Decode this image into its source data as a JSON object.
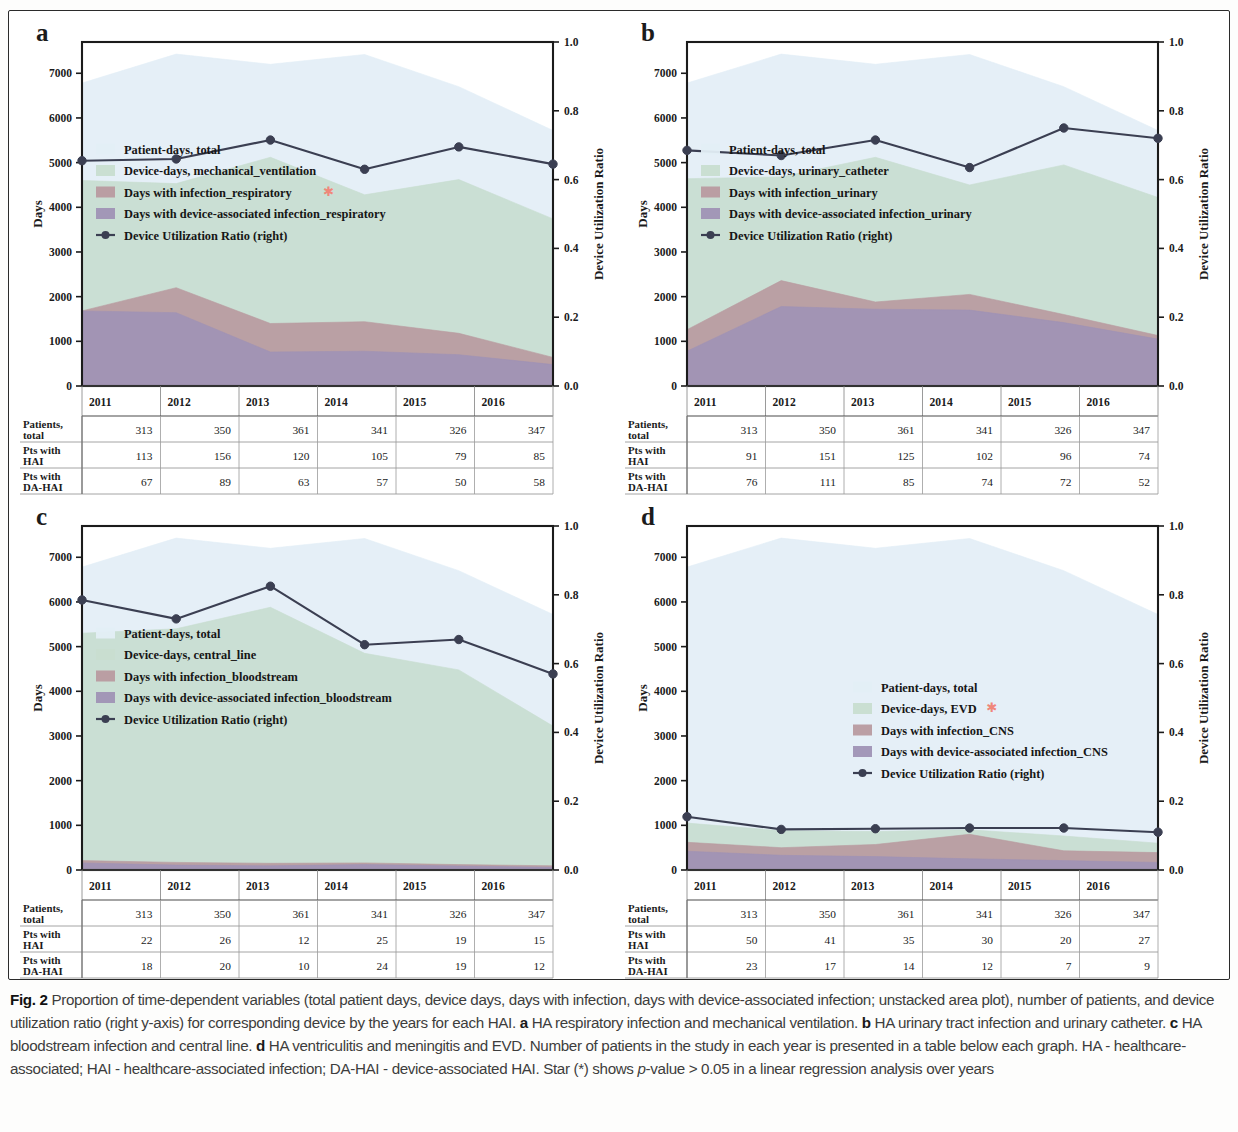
{
  "figure": {
    "label": "Fig. 2",
    "caption_parts": [
      {
        "t": "Proportion of time-dependent variables (total patient days, device days, days with infection, days with device-associated infection; unstacked area plot), number of patients, and device utilization ratio (right y-axis) for corresponding device by the years for each HAI. "
      },
      {
        "b": "a"
      },
      {
        "t": " HA respiratory infection and mechanical ventilation. "
      },
      {
        "b": "b"
      },
      {
        "t": " HA urinary tract infection and urinary catheter. "
      },
      {
        "b": "c"
      },
      {
        "t": " HA bloodstream infection and central line. "
      },
      {
        "b": "d"
      },
      {
        "t": " HA ventriculitis and meningitis and EVD. Number of patients in the study in each year is presented in a table below each graph. HA - healthcare-associated; HAI - healthcare-associated infection; DA-HAI - device-associated HAI. Star (*) shows "
      },
      {
        "i": "p"
      },
      {
        "t": "-value > 0.05 in a linear regression analysis over years"
      }
    ]
  },
  "colors": {
    "patient_days": "#e3eef6",
    "device_days": "#c8ddd0",
    "infection": "#b89aa0",
    "da_infection": "#9f92b5",
    "dur_line": "#3b3f52",
    "star": "#f0877a",
    "axis": "#1b1b1b",
    "table_border": "#9a9a9a"
  },
  "axes": {
    "left_label": "Days",
    "right_label": "Device Utilization Ratio",
    "left_ticks": [
      "0",
      "1000",
      "2000",
      "3000",
      "4000",
      "5000",
      "6000",
      "7000"
    ],
    "left_tick_values": [
      0,
      1000,
      2000,
      3000,
      4000,
      5000,
      6000,
      7000
    ],
    "right_ticks": [
      "0.0",
      "0.2",
      "0.4",
      "0.6",
      "0.8",
      "1.0"
    ],
    "right_tick_values": [
      0.0,
      0.2,
      0.4,
      0.6,
      0.8,
      1.0
    ],
    "ylim_days": [
      0,
      7700
    ],
    "ylim_ratio": [
      0.0,
      1.0
    ]
  },
  "years": [
    "2011",
    "2012",
    "2013",
    "2014",
    "2015",
    "2016"
  ],
  "table": {
    "row_labels": [
      "Patients,\ntotal",
      "Pts with\nHAI",
      "Pts with\nDA-HAI"
    ],
    "row_labels_flat": [
      [
        "Patients,",
        "total"
      ],
      [
        "Pts with",
        "HAI"
      ],
      [
        "Pts with",
        "DA-HAI"
      ]
    ]
  },
  "chart_data": [
    {
      "id": "a",
      "type": "area",
      "panel_letter": "a",
      "title": "HA respiratory infection and mechanical ventilation",
      "xlabel": "",
      "ylabel": "Days",
      "y2label": "Device Utilization Ratio",
      "ylim": [
        0,
        7700
      ],
      "y2lim": [
        0,
        1.0
      ],
      "grid": false,
      "legend_position": "upper-left",
      "x": [
        "2011",
        "2012",
        "2013",
        "2014",
        "2015",
        "2016"
      ],
      "series": [
        {
          "name": "Patient-days, total",
          "key": "patient_days",
          "star": false,
          "values": [
            6780,
            7430,
            7200,
            7420,
            6700,
            5720
          ]
        },
        {
          "name": "Device-days, mechanical_ventilation",
          "key": "device_days",
          "star": false,
          "values": [
            4600,
            4530,
            5120,
            4280,
            4620,
            3740
          ]
        },
        {
          "name": "Days with infection_respiratory",
          "key": "infection",
          "star": true,
          "values": [
            1680,
            2200,
            1400,
            1440,
            1180,
            640
          ]
        },
        {
          "name": "Days with device-associated infection_respiratory",
          "key": "da_infection",
          "star": false,
          "values": [
            1680,
            1640,
            760,
            780,
            700,
            480
          ]
        }
      ],
      "dur": {
        "name": "Device Utilization Ratio (right)",
        "values": [
          0.655,
          0.66,
          0.715,
          0.63,
          0.695,
          0.645
        ]
      },
      "table": {
        "columns": [
          "2011",
          "2012",
          "2013",
          "2014",
          "2015",
          "2016"
        ],
        "rows": [
          {
            "label_l1": "Patients,",
            "label_l2": "total",
            "star": false,
            "values": [
              "313",
              "350",
              "361",
              "341",
              "326",
              "347"
            ]
          },
          {
            "label_l1": "Pts with",
            "label_l2": "HAI",
            "star": false,
            "values": [
              "113",
              "156",
              "120",
              "105",
              "79",
              "85"
            ]
          },
          {
            "label_l1": "Pts with",
            "label_l2": "DA-HAI",
            "star": false,
            "values": [
              "67",
              "89",
              "63",
              "57",
              "50",
              "58"
            ]
          }
        ]
      }
    },
    {
      "id": "b",
      "type": "area",
      "panel_letter": "b",
      "title": "HA urinary tract infection and urinary catheter",
      "xlabel": "",
      "ylabel": "Days",
      "y2label": "Device Utilization Ratio",
      "ylim": [
        0,
        7700
      ],
      "y2lim": [
        0,
        1.0
      ],
      "grid": false,
      "legend_position": "upper-left",
      "x": [
        "2011",
        "2012",
        "2013",
        "2014",
        "2015",
        "2016"
      ],
      "series": [
        {
          "name": "Patient-days, total",
          "key": "patient_days",
          "star": false,
          "values": [
            6780,
            7430,
            7200,
            7420,
            6700,
            5720
          ]
        },
        {
          "name": "Device-days, urinary_catheter",
          "key": "device_days",
          "star": false,
          "values": [
            4640,
            4680,
            5120,
            4500,
            4950,
            4220
          ]
        },
        {
          "name": "Days with infection_urinary",
          "key": "infection",
          "star": false,
          "values": [
            1260,
            2360,
            1880,
            2050,
            1600,
            1130
          ]
        },
        {
          "name": "Days with device-associated infection_urinary",
          "key": "da_infection",
          "star": false,
          "values": [
            780,
            1780,
            1720,
            1700,
            1420,
            1050
          ]
        }
      ],
      "dur": {
        "name": "Device Utilization Ratio (right)",
        "values": [
          0.685,
          0.67,
          0.715,
          0.635,
          0.75,
          0.72
        ]
      },
      "table": {
        "columns": [
          "2011",
          "2012",
          "2013",
          "2014",
          "2015",
          "2016"
        ],
        "rows": [
          {
            "label_l1": "Patients,",
            "label_l2": "total",
            "star": false,
            "values": [
              "313",
              "350",
              "361",
              "341",
              "326",
              "347"
            ]
          },
          {
            "label_l1": "Pts with",
            "label_l2": "HAI",
            "star": false,
            "values": [
              "91",
              "151",
              "125",
              "102",
              "96",
              "74"
            ]
          },
          {
            "label_l1": "Pts with",
            "label_l2": "DA-HAI",
            "star": false,
            "values": [
              "76",
              "111",
              "85",
              "74",
              "72",
              "52"
            ]
          }
        ]
      }
    },
    {
      "id": "c",
      "type": "area",
      "panel_letter": "c",
      "title": "HA bloodstream infection and central line",
      "xlabel": "",
      "ylabel": "Days",
      "y2label": "Device Utilization Ratio",
      "ylim": [
        0,
        7700
      ],
      "y2lim": [
        0,
        1.0
      ],
      "grid": false,
      "legend_position": "upper-left",
      "x": [
        "2011",
        "2012",
        "2013",
        "2014",
        "2015",
        "2016"
      ],
      "series": [
        {
          "name": "Patient-days, total",
          "key": "patient_days",
          "star": false,
          "values": [
            6780,
            7430,
            7200,
            7420,
            6700,
            5720
          ]
        },
        {
          "name": "Device-days, central_line",
          "key": "device_days",
          "star": false,
          "values": [
            5300,
            5400,
            5880,
            4850,
            4480,
            3220
          ]
        },
        {
          "name": "Days with infection_bloodstream",
          "key": "infection",
          "star": false,
          "values": [
            210,
            170,
            150,
            160,
            120,
            95
          ]
        },
        {
          "name": "Days with device-associated infection_bloodstream",
          "key": "da_infection",
          "star": false,
          "values": [
            160,
            110,
            95,
            120,
            90,
            60
          ]
        }
      ],
      "dur": {
        "name": "Device Utilization Ratio (right)",
        "values": [
          0.785,
          0.73,
          0.825,
          0.655,
          0.67,
          0.57
        ]
      },
      "table": {
        "columns": [
          "2011",
          "2012",
          "2013",
          "2014",
          "2015",
          "2016"
        ],
        "rows": [
          {
            "label_l1": "Patients,",
            "label_l2": "total",
            "star": false,
            "values": [
              "313",
              "350",
              "361",
              "341",
              "326",
              "347"
            ]
          },
          {
            "label_l1": "Pts with",
            "label_l2": "HAI",
            "star": false,
            "values": [
              "22",
              "26",
              "12",
              "25",
              "19",
              "15"
            ]
          },
          {
            "label_l1": "Pts with",
            "label_l2": "DA-HAI",
            "star": false,
            "values": [
              "18",
              "20",
              "10",
              "24",
              "19",
              "12"
            ]
          }
        ]
      }
    },
    {
      "id": "d",
      "type": "area",
      "panel_letter": "d",
      "title": "HA ventriculitis and meningitis and EVD",
      "xlabel": "",
      "ylabel": "Days",
      "y2label": "Device Utilization Ratio",
      "ylim": [
        0,
        7700
      ],
      "y2lim": [
        0,
        1.0
      ],
      "grid": false,
      "legend_position": "middle",
      "x": [
        "2011",
        "2012",
        "2013",
        "2014",
        "2015",
        "2016"
      ],
      "series": [
        {
          "name": "Patient-days, total",
          "key": "patient_days",
          "star": false,
          "values": [
            6780,
            7430,
            7200,
            7420,
            6700,
            5720
          ]
        },
        {
          "name": "Device-days, EVD",
          "key": "device_days",
          "star": true,
          "values": [
            1050,
            880,
            860,
            900,
            760,
            600
          ]
        },
        {
          "name": "Days with infection_CNS",
          "key": "infection",
          "star": false,
          "values": [
            620,
            500,
            570,
            800,
            430,
            390
          ]
        },
        {
          "name": "Days with device-associated infection_CNS",
          "key": "da_infection",
          "star": false,
          "values": [
            420,
            330,
            300,
            250,
            210,
            170
          ]
        }
      ],
      "dur": {
        "name": "Device Utilization Ratio (right)",
        "values": [
          0.155,
          0.118,
          0.12,
          0.122,
          0.122,
          0.11
        ]
      },
      "table": {
        "columns": [
          "2011",
          "2012",
          "2013",
          "2014",
          "2015",
          "2016"
        ],
        "rows": [
          {
            "label_l1": "Patients,",
            "label_l2": "total",
            "star": false,
            "values": [
              "313",
              "350",
              "361",
              "341",
              "326",
              "347"
            ]
          },
          {
            "label_l1": "Pts with",
            "label_l2": "HAI",
            "star": true,
            "values": [
              "50",
              "41",
              "35",
              "30",
              "20",
              "27"
            ]
          },
          {
            "label_l1": "Pts with",
            "label_l2": "DA-HAI",
            "star": true,
            "values": [
              "23",
              "17",
              "14",
              "12",
              "7",
              "9"
            ]
          }
        ]
      }
    }
  ]
}
